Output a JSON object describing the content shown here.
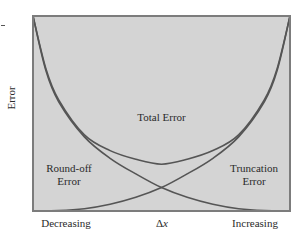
{
  "chart_data": {
    "type": "line",
    "title": "",
    "xlabel": "Δx",
    "ylabel": "Error",
    "x_tick_labels": {
      "left": "Decreasing",
      "right": "Increasing"
    },
    "xlim": [
      0,
      1
    ],
    "ylim": [
      0,
      1
    ],
    "grid": false,
    "legend": null,
    "colors": {
      "plot_bg": "#d4d4d4",
      "border": "#7c7c7c",
      "curve": "#555555"
    },
    "series": [
      {
        "name": "Round-off Error",
        "label": [
          "Round-off",
          "Error"
        ],
        "x": [
          0.0,
          0.05,
          0.1,
          0.2,
          0.3,
          0.4,
          0.5,
          0.6,
          0.7,
          0.8,
          0.9,
          1.0
        ],
        "y": [
          1.0,
          0.72,
          0.56,
          0.38,
          0.27,
          0.19,
          0.12,
          0.07,
          0.035,
          0.012,
          0.002,
          0.0
        ]
      },
      {
        "name": "Truncation Error",
        "label": [
          "Truncation",
          "Error"
        ],
        "x": [
          0.0,
          0.1,
          0.2,
          0.3,
          0.4,
          0.5,
          0.6,
          0.7,
          0.8,
          0.9,
          0.95,
          1.0
        ],
        "y": [
          0.0,
          0.002,
          0.012,
          0.035,
          0.07,
          0.12,
          0.19,
          0.27,
          0.38,
          0.56,
          0.72,
          1.0
        ]
      },
      {
        "name": "Total Error",
        "label": [
          "Total Error"
        ],
        "x": [
          0.0,
          0.05,
          0.1,
          0.2,
          0.3,
          0.4,
          0.5,
          0.6,
          0.7,
          0.8,
          0.9,
          0.95,
          1.0
        ],
        "y": [
          1.0,
          0.73,
          0.57,
          0.39,
          0.31,
          0.265,
          0.24,
          0.265,
          0.31,
          0.39,
          0.57,
          0.73,
          1.0
        ]
      }
    ]
  }
}
